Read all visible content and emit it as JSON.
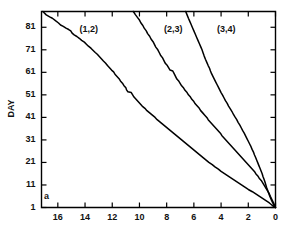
{
  "chart_data": {
    "type": "line",
    "title": "",
    "subtitle": "",
    "panel_letter": "a",
    "xlabel": "",
    "ylabel": "DAY",
    "xlim": [
      17.2,
      0
    ],
    "ylim": [
      1,
      88
    ],
    "x_reversed": true,
    "grid": false,
    "legend_position": "inline-annotations",
    "xticks": [
      16,
      14,
      12,
      10,
      8,
      6,
      4,
      2,
      0
    ],
    "xtick_labels": [
      "16",
      "14",
      "12",
      "10",
      "8",
      "6",
      "4",
      "2",
      "0"
    ],
    "yticks": [
      1,
      11,
      21,
      31,
      41,
      51,
      61,
      71,
      81
    ],
    "ytick_labels": [
      "1",
      "11",
      "21",
      "31",
      "41",
      "51",
      "61",
      "71",
      "81"
    ],
    "annotations": [
      {
        "text": "(1,2)",
        "x": 14.4,
        "y": 80.0
      },
      {
        "text": "(2,3)",
        "x": 8.2,
        "y": 80.0
      },
      {
        "text": "(3,4)",
        "x": 4.3,
        "y": 80.0
      }
    ],
    "series": [
      {
        "name": "(1,2)",
        "color": "#000000",
        "points": [
          [
            17.1,
            88.0
          ],
          [
            16.85,
            86.5
          ],
          [
            16.6,
            85.6
          ],
          [
            16.4,
            85.0
          ],
          [
            16.15,
            83.8
          ],
          [
            15.95,
            82.9
          ],
          [
            15.8,
            82.0
          ],
          [
            15.6,
            81.4
          ],
          [
            15.4,
            80.6
          ],
          [
            15.2,
            80.0
          ],
          [
            15.05,
            79.4
          ],
          [
            14.95,
            78.4
          ],
          [
            14.8,
            77.6
          ],
          [
            14.6,
            76.9
          ],
          [
            14.4,
            76.0
          ],
          [
            14.25,
            75.2
          ],
          [
            14.05,
            74.4
          ],
          [
            13.9,
            73.5
          ],
          [
            13.75,
            72.6
          ],
          [
            13.55,
            71.6
          ],
          [
            13.4,
            70.7
          ],
          [
            13.25,
            69.8
          ],
          [
            13.1,
            69.0
          ],
          [
            12.95,
            68.0
          ],
          [
            12.8,
            67.0
          ],
          [
            12.65,
            66.0
          ],
          [
            12.5,
            65.1
          ],
          [
            12.35,
            64.0
          ],
          [
            12.2,
            63.0
          ],
          [
            12.05,
            62.0
          ],
          [
            11.9,
            61.2
          ],
          [
            11.8,
            60.2
          ],
          [
            11.65,
            59.2
          ],
          [
            11.5,
            58.2
          ],
          [
            11.4,
            57.2
          ],
          [
            11.25,
            56.2
          ],
          [
            11.15,
            55.2
          ],
          [
            11.0,
            54.2
          ],
          [
            10.95,
            53.2
          ],
          [
            10.85,
            52.4
          ],
          [
            10.6,
            52.0
          ],
          [
            10.5,
            51.0
          ],
          [
            10.4,
            50.0
          ],
          [
            10.25,
            49.0
          ],
          [
            10.1,
            48.0
          ],
          [
            9.95,
            47.0
          ],
          [
            9.8,
            46.0
          ],
          [
            9.6,
            45.0
          ],
          [
            9.45,
            44.0
          ],
          [
            9.25,
            43.0
          ],
          [
            9.05,
            42.0
          ],
          [
            8.85,
            41.0
          ],
          [
            8.7,
            40.0
          ],
          [
            8.5,
            39.0
          ],
          [
            8.3,
            38.0
          ],
          [
            8.1,
            37.0
          ],
          [
            7.9,
            36.0
          ],
          [
            7.7,
            35.0
          ],
          [
            7.5,
            34.0
          ],
          [
            7.3,
            33.0
          ],
          [
            7.1,
            32.0
          ],
          [
            6.9,
            31.0
          ],
          [
            6.7,
            30.0
          ],
          [
            6.5,
            29.0
          ],
          [
            6.3,
            28.0
          ],
          [
            6.1,
            27.0
          ],
          [
            5.9,
            26.0
          ],
          [
            5.7,
            25.0
          ],
          [
            5.5,
            24.0
          ],
          [
            5.3,
            23.0
          ],
          [
            5.1,
            22.0
          ],
          [
            4.9,
            21.0
          ],
          [
            4.65,
            20.0
          ],
          [
            4.45,
            19.0
          ],
          [
            4.2,
            18.0
          ],
          [
            4.0,
            17.0
          ],
          [
            3.75,
            16.0
          ],
          [
            3.5,
            15.0
          ],
          [
            3.25,
            14.0
          ],
          [
            3.0,
            13.0
          ],
          [
            2.75,
            12.0
          ],
          [
            2.5,
            11.0
          ],
          [
            2.25,
            10.0
          ],
          [
            2.0,
            9.0
          ],
          [
            1.7,
            8.0
          ],
          [
            1.45,
            7.0
          ],
          [
            1.2,
            6.0
          ],
          [
            0.95,
            5.0
          ],
          [
            0.7,
            4.0
          ],
          [
            0.45,
            3.0
          ],
          [
            0.25,
            2.0
          ],
          [
            0.0,
            1.0
          ]
        ]
      },
      {
        "name": "(2,3)",
        "color": "#000000",
        "points": [
          [
            10.45,
            88.0
          ],
          [
            10.3,
            86.6
          ],
          [
            10.15,
            85.4
          ],
          [
            10.0,
            84.2
          ],
          [
            9.9,
            83.0
          ],
          [
            9.75,
            81.8
          ],
          [
            9.65,
            80.6
          ],
          [
            9.5,
            79.4
          ],
          [
            9.4,
            78.2
          ],
          [
            9.25,
            77.0
          ],
          [
            9.15,
            75.8
          ],
          [
            9.0,
            74.6
          ],
          [
            8.9,
            73.4
          ],
          [
            8.8,
            72.2
          ],
          [
            8.65,
            71.0
          ],
          [
            8.55,
            69.8
          ],
          [
            8.45,
            68.6
          ],
          [
            8.3,
            67.4
          ],
          [
            8.2,
            66.2
          ],
          [
            8.1,
            65.0
          ],
          [
            7.95,
            64.0
          ],
          [
            7.85,
            63.0
          ],
          [
            7.75,
            62.0
          ],
          [
            7.55,
            61.6
          ],
          [
            7.45,
            60.4
          ],
          [
            7.35,
            59.2
          ],
          [
            7.25,
            58.0
          ],
          [
            7.1,
            57.0
          ],
          [
            7.0,
            56.0
          ],
          [
            6.9,
            55.0
          ],
          [
            6.75,
            54.0
          ],
          [
            6.65,
            53.0
          ],
          [
            6.5,
            52.0
          ],
          [
            6.4,
            51.0
          ],
          [
            6.25,
            50.0
          ],
          [
            6.15,
            49.0
          ],
          [
            6.0,
            48.0
          ],
          [
            5.9,
            47.0
          ],
          [
            5.75,
            46.0
          ],
          [
            5.6,
            45.0
          ],
          [
            5.5,
            44.0
          ],
          [
            5.35,
            43.0
          ],
          [
            5.2,
            42.0
          ],
          [
            5.05,
            41.0
          ],
          [
            4.95,
            40.0
          ],
          [
            4.8,
            39.0
          ],
          [
            4.65,
            38.0
          ],
          [
            4.5,
            37.0
          ],
          [
            4.35,
            36.0
          ],
          [
            4.2,
            35.0
          ],
          [
            4.05,
            34.0
          ],
          [
            3.95,
            33.0
          ],
          [
            3.8,
            32.0
          ],
          [
            3.65,
            31.0
          ],
          [
            3.5,
            30.0
          ],
          [
            3.35,
            29.0
          ],
          [
            3.2,
            28.0
          ],
          [
            3.05,
            27.0
          ],
          [
            2.9,
            26.0
          ],
          [
            2.75,
            25.0
          ],
          [
            2.6,
            24.0
          ],
          [
            2.45,
            23.0
          ],
          [
            2.3,
            22.0
          ],
          [
            2.15,
            21.0
          ],
          [
            2.0,
            20.0
          ],
          [
            1.85,
            19.0
          ],
          [
            1.7,
            18.0
          ],
          [
            1.55,
            17.0
          ],
          [
            1.45,
            16.0
          ],
          [
            1.3,
            15.0
          ],
          [
            1.2,
            14.0
          ],
          [
            1.05,
            13.0
          ],
          [
            0.95,
            12.0
          ],
          [
            0.85,
            11.0
          ],
          [
            0.75,
            10.0
          ],
          [
            0.65,
            9.0
          ],
          [
            0.55,
            8.0
          ],
          [
            0.45,
            7.0
          ],
          [
            0.38,
            6.0
          ],
          [
            0.3,
            5.0
          ],
          [
            0.22,
            4.0
          ],
          [
            0.14,
            3.0
          ],
          [
            0.07,
            2.0
          ],
          [
            0.0,
            1.0
          ]
        ]
      },
      {
        "name": "(3,4)",
        "color": "#000000",
        "points": [
          [
            6.6,
            88.0
          ],
          [
            6.5,
            86.5
          ],
          [
            6.4,
            85.0
          ],
          [
            6.3,
            83.6
          ],
          [
            6.2,
            82.2
          ],
          [
            6.1,
            80.8
          ],
          [
            6.0,
            79.4
          ],
          [
            5.9,
            78.0
          ],
          [
            5.8,
            76.6
          ],
          [
            5.7,
            75.2
          ],
          [
            5.6,
            73.8
          ],
          [
            5.5,
            72.4
          ],
          [
            5.4,
            71.0
          ],
          [
            5.32,
            69.6
          ],
          [
            5.24,
            68.2
          ],
          [
            5.15,
            66.8
          ],
          [
            5.05,
            65.4
          ],
          [
            4.95,
            64.0
          ],
          [
            4.85,
            62.8
          ],
          [
            4.78,
            61.6
          ],
          [
            4.7,
            60.4
          ],
          [
            4.6,
            59.2
          ],
          [
            4.5,
            58.0
          ],
          [
            4.4,
            56.8
          ],
          [
            4.3,
            55.6
          ],
          [
            4.2,
            54.4
          ],
          [
            4.1,
            53.2
          ],
          [
            4.0,
            52.0
          ],
          [
            3.88,
            50.8
          ],
          [
            3.78,
            49.6
          ],
          [
            3.68,
            48.4
          ],
          [
            3.55,
            47.2
          ],
          [
            3.45,
            46.0
          ],
          [
            3.32,
            44.8
          ],
          [
            3.2,
            43.6
          ],
          [
            3.1,
            42.4
          ],
          [
            2.98,
            41.2
          ],
          [
            2.85,
            40.0
          ],
          [
            2.75,
            38.8
          ],
          [
            2.62,
            37.6
          ],
          [
            2.52,
            36.4
          ],
          [
            2.42,
            35.2
          ],
          [
            2.3,
            34.0
          ],
          [
            2.2,
            32.8
          ],
          [
            2.1,
            31.6
          ],
          [
            2.0,
            30.4
          ],
          [
            1.9,
            29.2
          ],
          [
            1.8,
            28.0
          ],
          [
            1.72,
            26.8
          ],
          [
            1.62,
            25.6
          ],
          [
            1.55,
            24.4
          ],
          [
            1.46,
            23.2
          ],
          [
            1.38,
            22.0
          ],
          [
            1.3,
            20.8
          ],
          [
            1.22,
            19.6
          ],
          [
            1.14,
            18.4
          ],
          [
            1.06,
            17.2
          ],
          [
            0.98,
            16.0
          ],
          [
            0.92,
            14.8
          ],
          [
            0.85,
            13.6
          ],
          [
            0.78,
            12.4
          ],
          [
            0.72,
            11.2
          ],
          [
            0.66,
            10.0
          ],
          [
            0.6,
            9.0
          ],
          [
            0.54,
            8.0
          ],
          [
            0.48,
            7.0
          ],
          [
            0.42,
            6.0
          ],
          [
            0.35,
            5.0
          ],
          [
            0.28,
            4.0
          ],
          [
            0.2,
            3.0
          ],
          [
            0.11,
            2.0
          ],
          [
            0.0,
            1.0
          ]
        ]
      }
    ]
  }
}
